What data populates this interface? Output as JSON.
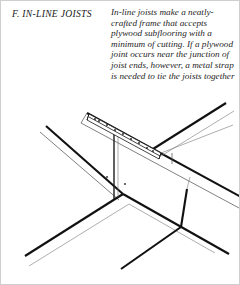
{
  "page": {
    "background_color": "#ffffff",
    "ink_color": "#111111"
  },
  "header": {
    "section_label": "F.",
    "section_title": "F.  IN-LINE JOISTS",
    "body_text": "In-line joists make a neatly-crafted frame that accepts plywood subflooring with a minimum of cutting. If a plywood joint occurs near the junction of joist ends, however, a metal strap is needed to tie the joists together",
    "body_lines": [
      "In-line joists make a",
      "neatly-crafted frame that",
      "accepts plywood",
      "subflooring with a",
      "minimum of cutting. If a",
      "plywood joint occurs near",
      "the junction of joist ends,",
      "however, a metal strap is",
      "needed to tie the joists",
      "together"
    ]
  },
  "figure": {
    "caption": "",
    "type": "isometric-line-drawing",
    "parts": [
      {
        "name": "metal-strap",
        "nail_holes": 9
      },
      {
        "name": "girder-beam"
      },
      {
        "name": "joist-left"
      },
      {
        "name": "joist-right"
      },
      {
        "name": "support-post"
      },
      {
        "name": "cross-joist-front"
      },
      {
        "name": "cross-joist-rear"
      }
    ]
  }
}
